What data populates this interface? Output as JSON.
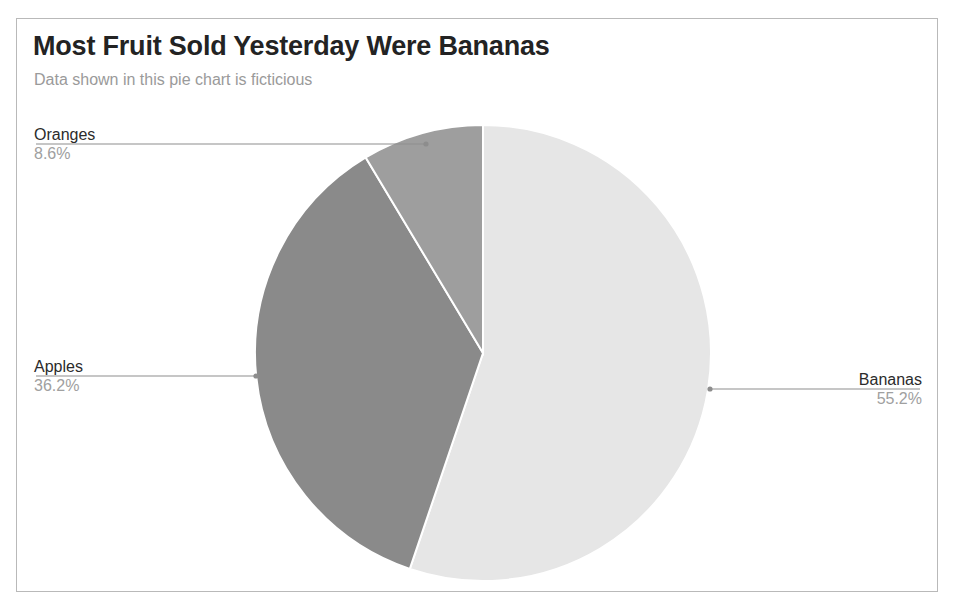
{
  "header": {
    "title": "Most Fruit Sold Yesterday Were Bananas",
    "subtitle": "Data shown in this pie chart is ficticious"
  },
  "chart_data": {
    "type": "pie",
    "title": "Most Fruit Sold Yesterday Were Bananas",
    "subtitle": "Data shown in this pie chart is ficticious",
    "xlabel": "",
    "ylabel": "",
    "legend_position": "none",
    "labels_position": "callout",
    "grid": false,
    "start_angle_deg": 0,
    "direction": "clockwise",
    "categories": [
      "Bananas",
      "Apples",
      "Oranges"
    ],
    "values": [
      55.2,
      36.2,
      8.6
    ],
    "value_labels": [
      "55.2%",
      "36.2%",
      "8.6%"
    ],
    "colors": [
      "#e6e6e6",
      "#8a8a8a",
      "#9e9e9e"
    ],
    "slice_border_color": "#ffffff",
    "slices": [
      {
        "name": "Bananas",
        "value": 55.2,
        "value_label": "55.2%",
        "color": "#e6e6e6",
        "callout_side": "right"
      },
      {
        "name": "Apples",
        "value": 36.2,
        "value_label": "36.2%",
        "color": "#8a8a8a",
        "callout_side": "left"
      },
      {
        "name": "Oranges",
        "value": 8.6,
        "value_label": "8.6%",
        "color": "#9e9e9e",
        "callout_side": "left"
      }
    ]
  },
  "style": {
    "frame_color": "#b9b9b9",
    "leader_line_color": "#8d8d8d",
    "title_color": "#232323",
    "subtitle_color": "#9a9a9a",
    "value_text_color": "#a0a0a0"
  }
}
